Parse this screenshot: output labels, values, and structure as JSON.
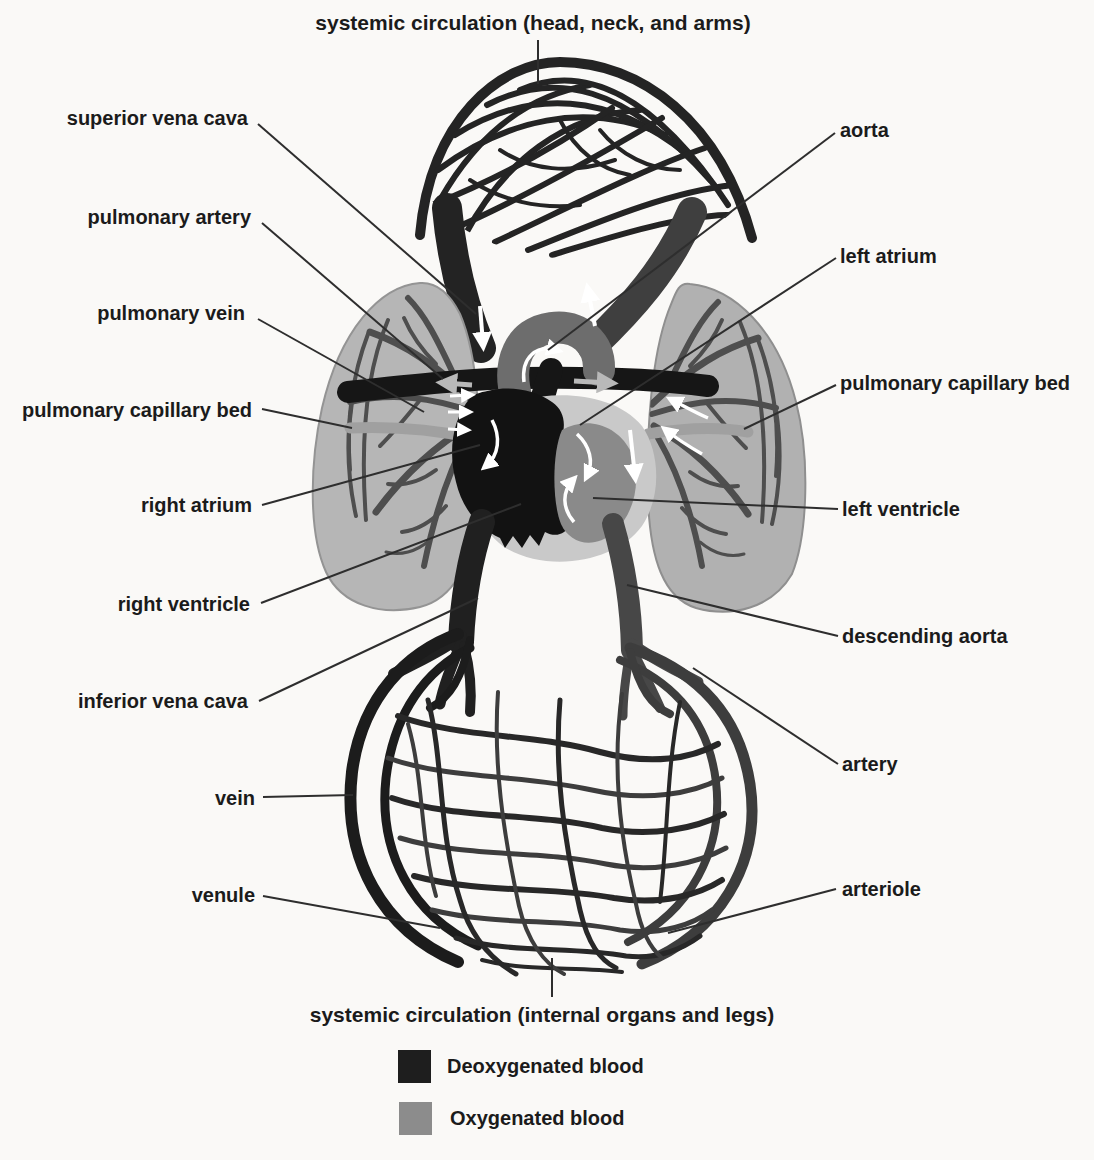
{
  "figure": {
    "top_caption": "systemic circulation (head, neck, and arms)",
    "bottom_caption": "systemic circulation (internal organs and legs)"
  },
  "labels_left": [
    {
      "text": "superior vena cava"
    },
    {
      "text": "pulmonary artery"
    },
    {
      "text": "pulmonary vein"
    },
    {
      "text": "pulmonary capillary bed"
    },
    {
      "text": "right atrium"
    },
    {
      "text": "right ventricle"
    },
    {
      "text": "inferior vena cava"
    },
    {
      "text": "vein"
    },
    {
      "text": "venule"
    }
  ],
  "labels_right": [
    {
      "text": "aorta"
    },
    {
      "text": "left atrium"
    },
    {
      "text": "pulmonary capillary bed"
    },
    {
      "text": "left ventricle"
    },
    {
      "text": "descending aorta"
    },
    {
      "text": "artery"
    },
    {
      "text": "arteriole"
    }
  ],
  "legend": {
    "items": [
      {
        "label": "Deoxygenated blood",
        "color": "#1e1e1e"
      },
      {
        "label": "Oxygenated blood",
        "color": "#8c8c8c"
      }
    ]
  },
  "colors": {
    "deoxygenated_vessel": "#1e1e1e",
    "oxygenated_vessel": "#8c8c8c",
    "aorta_arch": "#6d6d6d",
    "descending_aorta": "#474747",
    "lung_fill": "#b5b5b5",
    "heart_backing": "#c9c9c9",
    "label_text": "#1b1b1b",
    "leader_line": "#2e2e2e",
    "background": "#faf9f7",
    "flow_arrow": "#ffffff"
  }
}
